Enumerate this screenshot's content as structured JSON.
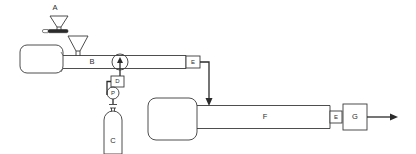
{
  "diagram": {
    "background_color": "#ffffff",
    "line_color": "#3a3a3a",
    "accent_color": "#2b2b2b",
    "components": {
      "sample_holder": {
        "label": "A",
        "icon": "funnel-with-bar-icon"
      },
      "feed_hopper": {
        "label": "",
        "icon": "funnel-icon"
      },
      "reactor_tube_primary": {
        "label": "B"
      },
      "gas_cylinder": {
        "label": "C",
        "icon": "gas-cylinder-icon"
      },
      "valve_d": {
        "label": "D"
      },
      "pressure_gauge": {
        "label": "P",
        "icon": "pressure-gauge-icon"
      },
      "thermocouple_circle": {
        "label": "",
        "icon": "circle-probe-icon"
      },
      "outlet_fitting_left": {
        "label": "E"
      },
      "reactor_tube_secondary": {
        "label": "F"
      },
      "outlet_fitting_right": {
        "label": "E"
      },
      "collector_g": {
        "label": "G"
      }
    },
    "flow_arrows": {
      "transfer_down_arrow": "arrow-down-icon",
      "probe_up_arrow": "arrow-up-icon",
      "product_out_arrow": "arrow-right-icon"
    }
  }
}
